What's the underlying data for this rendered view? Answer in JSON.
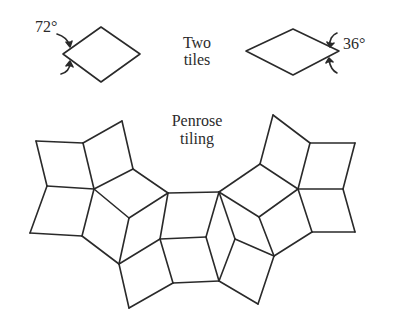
{
  "labels": {
    "angle_thick": "72°",
    "angle_thin": "36°",
    "tiles_line1": "Two",
    "tiles_line2": "tiles",
    "tiling_line1": "Penrose",
    "tiling_line2": "tiling"
  },
  "colors": {
    "stroke": "#2a2a2a",
    "background": "#ffffff"
  },
  "tiles": {
    "thick_rhombus": {
      "angle": "72°",
      "points": [
        [
          63,
          54
        ],
        [
          101,
          27
        ],
        [
          140,
          54
        ],
        [
          101,
          82
        ]
      ]
    },
    "thin_rhombus": {
      "angle": "36°",
      "points": [
        [
          246,
          51
        ],
        [
          293,
          29
        ],
        [
          339,
          51
        ],
        [
          293,
          75
        ]
      ]
    }
  },
  "penrose_tiling": {
    "edges": [
      [
        [
          122,
          121
        ],
        [
          83,
          143
        ]
      ],
      [
        [
          122,
          121
        ],
        [
          133,
          169
        ]
      ],
      [
        [
          83,
          143
        ],
        [
          36,
          141
        ]
      ],
      [
        [
          36,
          141
        ],
        [
          47,
          186
        ]
      ],
      [
        [
          83,
          143
        ],
        [
          94,
          189
        ]
      ],
      [
        [
          47,
          186
        ],
        [
          94,
          189
        ]
      ],
      [
        [
          94,
          189
        ],
        [
          133,
          169
        ]
      ],
      [
        [
          133,
          169
        ],
        [
          168,
          193
        ]
      ],
      [
        [
          47,
          186
        ],
        [
          30,
          233
        ]
      ],
      [
        [
          30,
          233
        ],
        [
          82,
          236
        ]
      ],
      [
        [
          94,
          189
        ],
        [
          82,
          236
        ]
      ],
      [
        [
          94,
          189
        ],
        [
          129,
          218
        ]
      ],
      [
        [
          129,
          218
        ],
        [
          168,
          193
        ]
      ],
      [
        [
          82,
          236
        ],
        [
          119,
          264
        ]
      ],
      [
        [
          129,
          218
        ],
        [
          119,
          264
        ]
      ],
      [
        [
          168,
          193
        ],
        [
          160,
          239
        ]
      ],
      [
        [
          119,
          264
        ],
        [
          160,
          239
        ]
      ],
      [
        [
          119,
          264
        ],
        [
          129,
          308
        ]
      ],
      [
        [
          129,
          308
        ],
        [
          173,
          283
        ]
      ],
      [
        [
          160,
          239
        ],
        [
          173,
          283
        ]
      ],
      [
        [
          168,
          193
        ],
        [
          219,
          192
        ]
      ],
      [
        [
          160,
          239
        ],
        [
          206,
          237
        ]
      ],
      [
        [
          173,
          283
        ],
        [
          219,
          281
        ]
      ],
      [
        [
          206,
          237
        ],
        [
          219,
          192
        ]
      ],
      [
        [
          206,
          237
        ],
        [
          219,
          281
        ]
      ],
      [
        [
          219,
          192
        ],
        [
          235,
          239
        ]
      ],
      [
        [
          235,
          239
        ],
        [
          219,
          281
        ]
      ],
      [
        [
          219,
          192
        ],
        [
          260,
          164
        ]
      ],
      [
        [
          219,
          192
        ],
        [
          259,
          217
        ]
      ],
      [
        [
          235,
          239
        ],
        [
          274,
          256
        ]
      ],
      [
        [
          259,
          217
        ],
        [
          298,
          189
        ]
      ],
      [
        [
          259,
          217
        ],
        [
          274,
          256
        ]
      ],
      [
        [
          219,
          281
        ],
        [
          258,
          304
        ]
      ],
      [
        [
          258,
          304
        ],
        [
          274,
          256
        ]
      ],
      [
        [
          260,
          164
        ],
        [
          298,
          189
        ]
      ],
      [
        [
          260,
          164
        ],
        [
          273,
          115
        ]
      ],
      [
        [
          273,
          115
        ],
        [
          310,
          143
        ]
      ],
      [
        [
          310,
          143
        ],
        [
          298,
          189
        ]
      ],
      [
        [
          310,
          143
        ],
        [
          355,
          143
        ]
      ],
      [
        [
          355,
          143
        ],
        [
          343,
          189
        ]
      ],
      [
        [
          298,
          189
        ],
        [
          343,
          189
        ]
      ],
      [
        [
          343,
          189
        ],
        [
          355,
          232
        ]
      ],
      [
        [
          355,
          232
        ],
        [
          312,
          232
        ]
      ],
      [
        [
          298,
          189
        ],
        [
          312,
          232
        ]
      ],
      [
        [
          312,
          232
        ],
        [
          274,
          256
        ]
      ]
    ]
  }
}
